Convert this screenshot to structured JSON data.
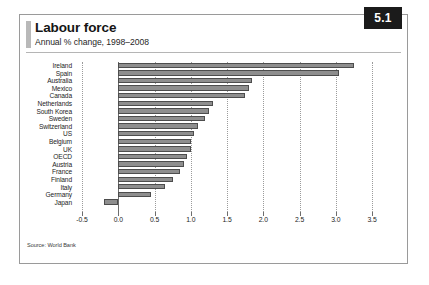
{
  "figure": {
    "number": "5.1",
    "title": "Labour force",
    "subtitle": "Annual % change, 1998–2008",
    "source": "Source: World Bank"
  },
  "chart_data": {
    "type": "bar",
    "orientation": "horizontal",
    "title": "Labour force",
    "subtitle": "Annual % change, 1998–2008",
    "xlabel": "",
    "ylabel": "",
    "xlim": [
      -0.5,
      3.5
    ],
    "xticks": [
      "-0.5",
      "0.0",
      "0.5",
      "1.0",
      "1.5",
      "2.0",
      "2.5",
      "3.0",
      "3.5"
    ],
    "xtick_values": [
      -0.5,
      0.0,
      0.5,
      1.0,
      1.5,
      2.0,
      2.5,
      3.0,
      3.5
    ],
    "grid": true,
    "legend": false,
    "categories": [
      "Ireland",
      "Spain",
      "Australia",
      "Mexico",
      "Canada",
      "Netherlands",
      "South Korea",
      "Sweden",
      "Switzerland",
      "US",
      "Belgium",
      "UK",
      "OECD",
      "Austria",
      "France",
      "Finland",
      "Italy",
      "Germany",
      "Japan"
    ],
    "values": [
      3.25,
      3.05,
      1.85,
      1.8,
      1.75,
      1.3,
      1.25,
      1.2,
      1.1,
      1.05,
      1.0,
      1.0,
      0.95,
      0.9,
      0.85,
      0.75,
      0.65,
      0.45,
      -0.2
    ],
    "colors": {
      "bar_fill": "#8e8e8e",
      "bar_border": "#4d4d4d",
      "grid": "#9b9b9b",
      "axis": "#6d6d6d",
      "badge_bg": "#1b1b1b",
      "badge_text": "#ffffff"
    }
  }
}
